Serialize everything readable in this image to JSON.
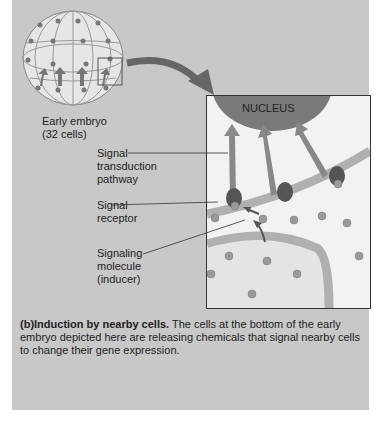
{
  "embryo": {
    "label_line1": "Early embryo",
    "label_line2": "(32 cells)"
  },
  "inset": {
    "nucleus_label": "NUCLEUS"
  },
  "labels": {
    "signal_transduction": [
      "Signal",
      "transduction",
      "pathway"
    ],
    "signal_receptor": [
      "Signal",
      "receptor"
    ],
    "signaling_molecule": [
      "Signaling",
      "molecule",
      "(inducer)"
    ]
  },
  "caption": {
    "prefix": "(b)",
    "title": "Induction by nearby cells.",
    "body": " The cells at the bottom of the early embryo depicted here are releasing chemicals that signal nearby cells to change their gene expression."
  },
  "colors": {
    "panel_bg": "#c8c8c8",
    "nucleus": "#7a7a7a",
    "membrane": "#b0b0b0",
    "arrow": "#808080"
  }
}
